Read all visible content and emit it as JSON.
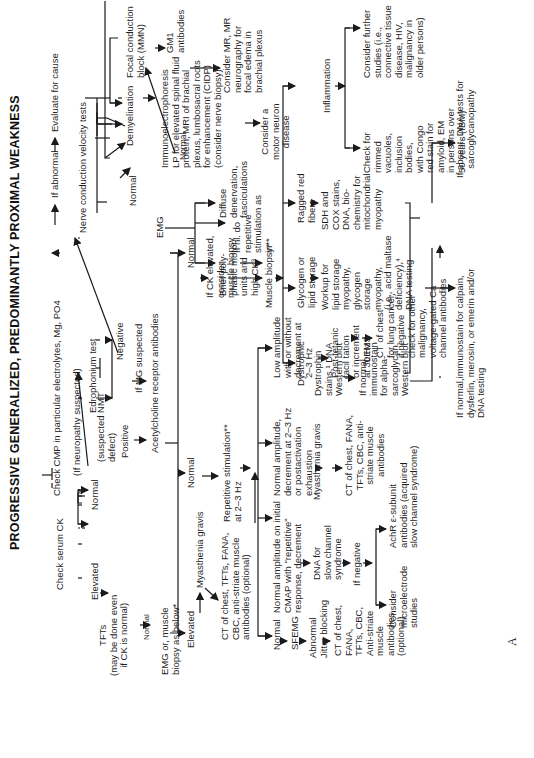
{
  "title": "PROGRESSIVE GENERALIZED, PREDOMINANTLY PROXIMAL WEAKNESS",
  "figure_label": "A",
  "orientation": "rotated 90° counter-clockwise",
  "nodes": {
    "check_cmp": "Check CMP in particular electrolytes, Mg, PO4",
    "if_abnormal": "If abnormal",
    "evaluate_cause": "Evaluate for cause",
    "check_ck": "Check serum CK",
    "if_neuropathy": "(If neuropathy suspected)",
    "ncv": "Nerve conduction velocity tests",
    "elevated_1": "Elevated",
    "normal_ck": "Normal",
    "suspected_nmt": "(suspected NMT\ndefect)",
    "tfts": "TFTs\n(may be done even\nif CK is normal)",
    "normal_tft": "Normal",
    "emg_or_biopsy": "EMG or, muscle\nbiopsy as below*",
    "edrophonium": "Edrophonium test",
    "positive": "Positive",
    "negative": "Negative",
    "if_mg_suspected": "If MG suspected",
    "achr_ab": "Acetylcholine receptor antibodies",
    "elevated_2": "Elevated",
    "normal_achr": "Normal",
    "normal_achr_2": "Normal",
    "mg_1": "Myasthenia gravis",
    "ct_chest_1": "CT of chest, TFTs, FANA,\nCBC, anti-striate muscle\nantibodies (optional)",
    "rep_stim": "Repetitive stimulation**\nat 2–3 Hz",
    "if_ck_elevated": "If CK elevated,\nconsider\nmuscle biopsy",
    "normal_emg_arrow": "Normal",
    "normal_rs": "Normal",
    "sfemg": "SFEMG",
    "abnormal_jitter": "Abnormal\nJitter blocking",
    "ct_chest_2": "CT of chest,\nFANA,\nTFTs, CBC,\nAnti-striate\nmuscle\nantibodies\n(optional)",
    "normal_amp_rep": "Normal amplitude on initial\nCMAP with \"repetitive\"\nresponse, decrement",
    "dna_slow": "DNA for\nslow channel\nsyndrome",
    "if_negative": "If negative",
    "microelectrode": "Consider\nmicroelectrode\nstudies",
    "achr_epsilon": "AchR ε-subunit\nantibodies (acquired\nslow channel syndrome)",
    "normal_amp_dec": "Normal amplitude,\ndecrement at 2–3 Hz\nor postactivation\nexhaustion",
    "mg_2": "Myasthenia gravis",
    "ct_chest_3": "CT of chest, FANA,\nTFTs, CBC, anti-\nstriate muscle\nantibodies",
    "low_amp": "Low amplitude\nwith or without\ndecrement at\n2–3 Hz",
    "post_tetanic": "Post-tetanic\nfacil tation\nor increment\nat 30 Hz",
    "lems": "LEMS",
    "ct_lung": "CT of chest\nfor lung cancer,\nif negative\ncheck for other\nmalignancy,\nvoltage-gated Ca\nchannel antibodies",
    "demyelination": "Demyelination",
    "focal_block": "Focal conduction\nblock (MMN)",
    "normal_ncv": "Normal",
    "immuno": "Immunoelectrophoresis\nLP for elevated spinal fluid\nprotein, MRI of brachial\nplexus, lumbosacral roots\nfor enhancement (CIDP)\n(consider nerve biopsy)²",
    "gm1": "GM1\nantibodies",
    "consider_mr": "Consider MR, MR\nneurography for\nfocal edema in\nbrachial plexus",
    "emg": "EMG",
    "diffuse_denerv": "Diffuse\ndenervation,\nfasciculations",
    "motor_neuron": "Consider a\nmotor neuron\ndisease",
    "brief_poly": "Brief poly-\nphasic motor\nunits and\nhigh CK³",
    "if_nl": "If nl. do\nrepetitive\nstimulation as\nin**",
    "muscle_biopsy": "Muscle biopsy*",
    "dystrophic": "Dystrophic",
    "dystrophin": "Dystrophin\nstains,¹ DNA\nWestern blot",
    "if_normal_alpha": "If normal,\nimmunostain\nfor alpha-\nsarcoglycan,\nWestern blot",
    "if_normal_calpain": "If normal,immunostain for calpain,\ndysferlin, merosin, or emerin and/or\nDNA testing",
    "if_absent": "If absent, DNA tests for\nsarcoglycanopathy",
    "glycogen": "Glycogen or\nlipid storage",
    "workup_lipid": "Workup for\nlipid storage\nmyopathy,\nglycogen\nstorage\nmyopathy,\n(i.e., acid maltase\ndeficiency),⁴\nDNA testing",
    "ragged_red": "Ragged red\nfibers",
    "sdh_cox": "SDH and\nCOX stains,\nDNA, bio-\nchemistry for\nmitochondrial\nmyopathy",
    "inflammation": "Inflammation",
    "check_rimmed": "Check for\nrimmed\nvacuoles,\ninclusion\nbodies,\nwith Congo\nred stain for\namyloid, EM\nin persons over\n50 years (IBM)",
    "consider_further": "Consider further\nstudies (i.e.,\nconnective tissue\ndisease, HIV,\nmalignancy in\nolder persons)"
  }
}
